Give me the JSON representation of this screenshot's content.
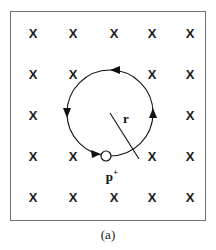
{
  "figure": {
    "caption": "(a)",
    "description_kind": "physics-diagram",
    "frame": {
      "x": 10,
      "y": 11,
      "width": 196,
      "height": 210,
      "border_color": "#6f7072"
    }
  },
  "field": {
    "symbol": "X",
    "meaning_label": "magnetic-field-into-page",
    "color": "#1b1b1b",
    "columns_x": [
      33,
      76,
      119,
      160,
      189
    ],
    "rows_y": [
      34,
      76,
      116,
      157,
      198
    ],
    "marks": [
      {
        "row": 0,
        "col": 0,
        "x": 33,
        "y": 34,
        "symbol": "X"
      },
      {
        "row": 0,
        "col": 1,
        "x": 73,
        "y": 34,
        "symbol": "X"
      },
      {
        "row": 0,
        "col": 2,
        "x": 114,
        "y": 34,
        "symbol": "X"
      },
      {
        "row": 0,
        "col": 3,
        "x": 152,
        "y": 34,
        "symbol": "X"
      },
      {
        "row": 0,
        "col": 4,
        "x": 190,
        "y": 34,
        "symbol": "X"
      },
      {
        "row": 1,
        "col": 0,
        "x": 33,
        "y": 75,
        "symbol": "X"
      },
      {
        "row": 1,
        "col": 1,
        "x": 73,
        "y": 75,
        "symbol": "X"
      },
      {
        "row": 1,
        "col": 3,
        "x": 152,
        "y": 75,
        "symbol": "X"
      },
      {
        "row": 1,
        "col": 4,
        "x": 190,
        "y": 75,
        "symbol": "X"
      },
      {
        "row": 2,
        "col": 0,
        "x": 33,
        "y": 116,
        "symbol": "X"
      },
      {
        "row": 2,
        "col": 4,
        "x": 190,
        "y": 116,
        "symbol": "X"
      },
      {
        "row": 3,
        "col": 0,
        "x": 33,
        "y": 157,
        "symbol": "X"
      },
      {
        "row": 3,
        "col": 1,
        "x": 73,
        "y": 157,
        "symbol": "X"
      },
      {
        "row": 3,
        "col": 3,
        "x": 152,
        "y": 157,
        "symbol": "X"
      },
      {
        "row": 3,
        "col": 4,
        "x": 190,
        "y": 157,
        "symbol": "X"
      },
      {
        "row": 4,
        "col": 0,
        "x": 33,
        "y": 198,
        "symbol": "X"
      },
      {
        "row": 4,
        "col": 1,
        "x": 73,
        "y": 198,
        "symbol": "X"
      },
      {
        "row": 4,
        "col": 2,
        "x": 114,
        "y": 198,
        "symbol": "X"
      },
      {
        "row": 4,
        "col": 3,
        "x": 152,
        "y": 198,
        "symbol": "X"
      },
      {
        "row": 4,
        "col": 4,
        "x": 190,
        "y": 198,
        "symbol": "X"
      }
    ]
  },
  "orbit": {
    "center_x": 110,
    "center_y": 113,
    "radius": 43,
    "stroke_color": "#111111",
    "stroke_width": 1.1,
    "direction_label": "clockwise",
    "arrowheads": [
      {
        "name": "top-arrowhead",
        "angle_deg": 270,
        "points": "left"
      },
      {
        "name": "left-arrowhead",
        "angle_deg": 180,
        "points": "down"
      },
      {
        "name": "right-arrowhead",
        "angle_deg": 0,
        "points": "up"
      },
      {
        "name": "bottom-arrowhead",
        "angle_deg": 100,
        "points": "right"
      }
    ]
  },
  "radius_line": {
    "label": "r",
    "label_x": 126,
    "label_y": 118,
    "from_x": 110,
    "from_y": 113,
    "to_x": 139,
    "to_y": 159,
    "color": "#111111"
  },
  "particle": {
    "label_text": "p",
    "label_charge": "+",
    "label_x": 112,
    "label_y": 176,
    "marker_x": 106,
    "marker_y": 156,
    "marker_radius": 5,
    "marker_fill": "#ffffff",
    "marker_stroke": "#111111"
  }
}
